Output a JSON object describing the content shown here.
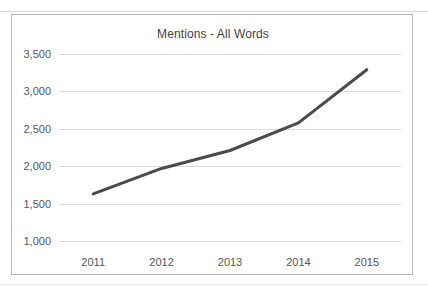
{
  "chart_data": {
    "type": "line",
    "title": "Mentions - All Words",
    "xlabel": "",
    "ylabel": "",
    "categories": [
      "2011",
      "2012",
      "2013",
      "2014",
      "2015"
    ],
    "series": [
      {
        "name": "Mentions - All Words",
        "values": [
          1630,
          1970,
          2210,
          2580,
          3290
        ],
        "color": "#4a4a4a"
      }
    ],
    "ylim": [
      1000,
      3500
    ],
    "y_ticks": [
      1000,
      1500,
      2000,
      2500,
      3000,
      3500
    ],
    "y_tick_labels": [
      "1,000",
      "1,500",
      "2,000",
      "2,500",
      "3,000",
      "3,500"
    ],
    "grid": true,
    "legend": "none",
    "colors": {
      "line": "#4a4a4a",
      "gridline": "#dcdcdc",
      "frame": "#b4b4b4",
      "text": "#555555",
      "title_text": "#3f3f3f",
      "background": "#ffffff"
    }
  }
}
